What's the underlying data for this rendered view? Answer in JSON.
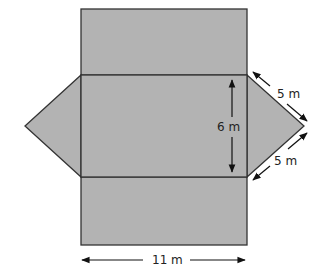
{
  "diagram": {
    "fill_color": "#b3b3b3",
    "stroke_color": "#333333",
    "labels": {
      "slant_top": "5 m",
      "slant_bottom": "5 m",
      "height": "6 m",
      "width": "11 m"
    }
  }
}
